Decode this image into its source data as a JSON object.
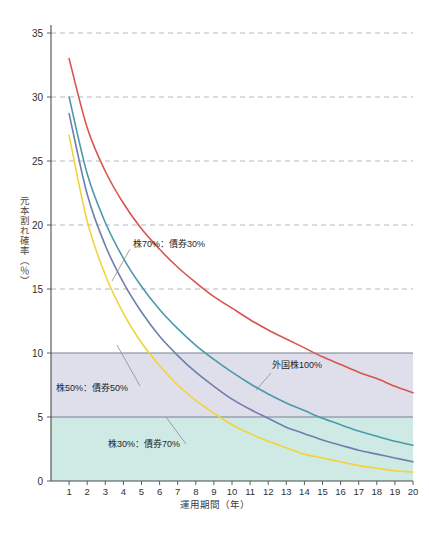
{
  "chart_data": {
    "type": "line",
    "title": "",
    "xlabel": "運用期間（年）",
    "ylabel": "元本割れ確率（％）",
    "xlim": [
      0,
      20
    ],
    "ylim": [
      0,
      35
    ],
    "grid": true,
    "legend_position": "inline-annotations",
    "x": [
      1,
      2,
      3,
      4,
      5,
      6,
      7,
      8,
      9,
      10,
      11,
      12,
      13,
      14,
      15,
      16,
      17,
      18,
      19,
      20
    ],
    "xtick_labels": [
      "1",
      "2",
      "3",
      "4",
      "5",
      "6",
      "7",
      "8",
      "9",
      "10",
      "11",
      "12",
      "13",
      "14",
      "15",
      "16",
      "17",
      "18",
      "19",
      "20"
    ],
    "ytick_labels": [
      "0",
      "5",
      "10",
      "15",
      "20",
      "25",
      "30",
      "35"
    ],
    "yticks": [
      0,
      5,
      10,
      15,
      20,
      25,
      30,
      35
    ],
    "gridline_values": [
      15,
      20,
      25,
      30,
      35
    ],
    "solid_line_values": [
      5,
      10
    ],
    "series": [
      {
        "name": "外国株100%",
        "color": "#d9534f",
        "values": [
          33.0,
          27.6,
          24.2,
          21.7,
          19.7,
          18.1,
          16.7,
          15.5,
          14.4,
          13.5,
          12.6,
          11.8,
          11.1,
          10.4,
          9.7,
          9.1,
          8.5,
          8.0,
          7.4,
          6.9
        ]
      },
      {
        "name": "株70%：債券30%",
        "color": "#4a9aa8",
        "values": [
          30.0,
          24.0,
          20.2,
          17.4,
          15.2,
          13.4,
          11.9,
          10.6,
          9.5,
          8.5,
          7.6,
          6.8,
          6.1,
          5.5,
          4.9,
          4.4,
          3.9,
          3.5,
          3.1,
          2.8
        ]
      },
      {
        "name": "株50%：債券50%",
        "color": "#6f7fad",
        "values": [
          28.7,
          22.4,
          18.4,
          15.5,
          13.2,
          11.3,
          9.8,
          8.5,
          7.4,
          6.4,
          5.6,
          4.9,
          4.2,
          3.7,
          3.2,
          2.8,
          2.4,
          2.1,
          1.8,
          1.5
        ]
      },
      {
        "name": "株30%：債券70%",
        "color": "#f2d33c",
        "values": [
          27.0,
          20.3,
          16.1,
          13.1,
          10.8,
          9.0,
          7.5,
          6.3,
          5.3,
          4.4,
          3.7,
          3.1,
          2.6,
          2.1,
          1.8,
          1.5,
          1.2,
          1.0,
          0.8,
          0.7
        ]
      }
    ],
    "bands": [
      {
        "name": "band-5-10",
        "from": 5,
        "to": 10,
        "color": "#dfdfeb"
      },
      {
        "name": "band-0-5",
        "from": 0,
        "to": 5,
        "color": "#cfeae4"
      }
    ],
    "annotations": [
      {
        "name": "annotation-kabu70",
        "text": "株70%：債券30%",
        "x": 133,
        "y": 247
      },
      {
        "name": "annotation-gaikokukabu100",
        "text": "外国株100%",
        "x": 272,
        "y": 368
      },
      {
        "name": "annotation-kabu50",
        "text": "株50%：債券50%",
        "x": 56,
        "y": 391
      },
      {
        "name": "annotation-kabu30",
        "text": "株30%：債券70%",
        "x": 108,
        "y": 447
      }
    ],
    "axis_color": "#4c4c4c",
    "grid_color": "#9aa0b0",
    "background": "#ffffff"
  }
}
